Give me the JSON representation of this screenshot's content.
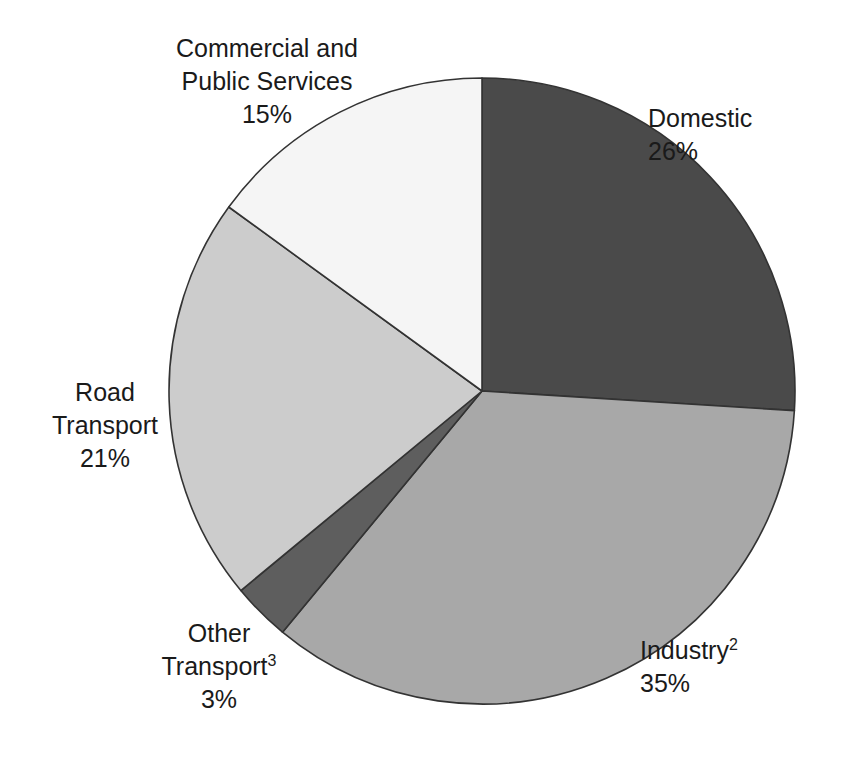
{
  "figure": {
    "background_color": "#ffffff",
    "text_color": "#1a1a1a",
    "outline_color": "#333333"
  },
  "chart_data": {
    "type": "pie",
    "title": "",
    "subtitle": "",
    "xlabel": "",
    "ylabel": "",
    "units": "percent",
    "total": 100,
    "start_angle_deg": 0,
    "direction": "clockwise",
    "grid": false,
    "legend": "none",
    "labels_position": "outside",
    "categories": [
      "Domestic",
      "Industry",
      "Other Transport",
      "Road Transport",
      "Commercial and Public Services"
    ],
    "values": [
      26,
      35,
      3,
      21,
      15
    ],
    "value_labels": [
      "26%",
      "35%",
      "3%",
      "21%",
      "15%"
    ],
    "colors": [
      "#4a4a4a",
      "#a8a8a8",
      "#5e5e5e",
      "#cccccc",
      "#f5f5f5"
    ],
    "footnote_markers": [
      "",
      "2",
      "3",
      "",
      ""
    ],
    "slices": [
      {
        "name": "domestic",
        "label_lines": [
          "Domestic"
        ],
        "footnote": "",
        "value": 26,
        "value_label": "26%",
        "color": "#4a4a4a"
      },
      {
        "name": "industry",
        "label_lines": [
          "Industry"
        ],
        "footnote": "2",
        "value": 35,
        "value_label": "35%",
        "color": "#a8a8a8"
      },
      {
        "name": "other-transport",
        "label_lines": [
          "Other",
          "Transport"
        ],
        "footnote": "3",
        "value": 3,
        "value_label": "3%",
        "color": "#5e5e5e"
      },
      {
        "name": "road-transport",
        "label_lines": [
          "Road",
          "Transport"
        ],
        "footnote": "",
        "value": 21,
        "value_label": "21%",
        "color": "#cccccc"
      },
      {
        "name": "commercial-public-services",
        "label_lines": [
          "Commercial and",
          "Public Services"
        ],
        "footnote": "",
        "value": 15,
        "value_label": "15%",
        "color": "#f5f5f5"
      }
    ],
    "geometry": {
      "center_x": 482,
      "center_y": 391,
      "radius": 313
    }
  }
}
